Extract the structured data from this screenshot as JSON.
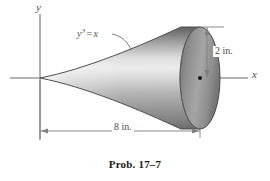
{
  "figure": {
    "caption": "Prob. 17–7",
    "background_color": "#ffffff",
    "axes": {
      "y_label": "y",
      "x_label": "x",
      "axis_color": "#8a8a8a",
      "origin": {
        "x": 40,
        "y": 78
      }
    },
    "curve": {
      "equation_prefix": "y",
      "equation_exponent": "3",
      "equation_sign": "=",
      "equation_suffix": "x",
      "equation_full": "y³ = x",
      "leader_color": "#6b6b6b"
    },
    "solid": {
      "apex": {
        "x": 40,
        "y": 78
      },
      "cap_center": {
        "x": 200,
        "y": 78
      },
      "cap_radius_y": 54,
      "cap_radius_x": 20,
      "shade_dark": "#6e6e6e",
      "shade_mid": "#9e9e9e",
      "shade_light": "#e6e6e6",
      "outline_color": "#4d4d4d"
    },
    "dimensions": [
      {
        "name": "height",
        "label": "2 in.",
        "orientation": "vertical",
        "value": 2,
        "unit": "in.",
        "from_y": 27,
        "to_y": 78,
        "line_x": 207
      },
      {
        "name": "length",
        "label": "8 in.",
        "orientation": "horizontal",
        "value": 8,
        "unit": "in.",
        "from_x": 40,
        "to_x": 200,
        "line_y": 131
      }
    ],
    "dimension_line_color": "#7a7a7a",
    "center_dot_color": "#1c1c1c"
  }
}
